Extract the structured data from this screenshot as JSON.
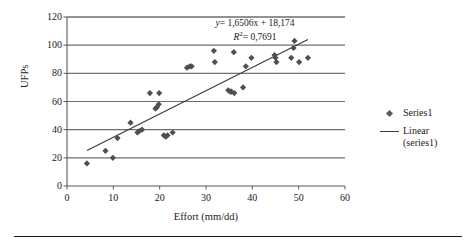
{
  "chart_data": {
    "type": "scatter",
    "title": "",
    "xlabel": "Effort (mm/dd)",
    "ylabel": "UFPs",
    "xlim": [
      0,
      60
    ],
    "ylim": [
      0,
      120
    ],
    "xticks": [
      0,
      10,
      20,
      30,
      40,
      50,
      60
    ],
    "yticks": [
      0,
      20,
      40,
      60,
      80,
      100,
      120
    ],
    "grid": "horizontal",
    "legend_position": "right",
    "series": [
      {
        "name": "Series1",
        "type": "scatter",
        "marker": "diamond",
        "color": "#4f4f4f",
        "points": [
          [
            4.3,
            16
          ],
          [
            8.3,
            25
          ],
          [
            9.9,
            20
          ],
          [
            10.9,
            34
          ],
          [
            13.7,
            45
          ],
          [
            15.2,
            38
          ],
          [
            15.6,
            39
          ],
          [
            16.2,
            40
          ],
          [
            17.9,
            66
          ],
          [
            19.1,
            55
          ],
          [
            19.4,
            56
          ],
          [
            19.8,
            58
          ],
          [
            19.9,
            66
          ],
          [
            20.9,
            36
          ],
          [
            21.3,
            35
          ],
          [
            21.7,
            36
          ],
          [
            22.8,
            38
          ],
          [
            25.9,
            84
          ],
          [
            26.5,
            85
          ],
          [
            26.9,
            85
          ],
          [
            31.7,
            96
          ],
          [
            31.9,
            88
          ],
          [
            34.8,
            68
          ],
          [
            35.2,
            67
          ],
          [
            35.5,
            67
          ],
          [
            36.1,
            66
          ],
          [
            36.0,
            95
          ],
          [
            38.0,
            70
          ],
          [
            38.6,
            85
          ],
          [
            39.8,
            91
          ],
          [
            44.8,
            93
          ],
          [
            45.0,
            91
          ],
          [
            45.2,
            88
          ],
          [
            48.4,
            91
          ],
          [
            48.9,
            98
          ],
          [
            49.1,
            103
          ],
          [
            50.1,
            88
          ],
          [
            52.0,
            91
          ]
        ]
      },
      {
        "name": "Linear (series1)",
        "type": "line",
        "color": "#3a3a3a",
        "slope": 1.6506,
        "intercept": 18.174,
        "x_start": 4.3,
        "x_end": 52.0
      }
    ],
    "annotations": [
      {
        "text": "y = 1,6506x + 18,174",
        "equation_y": "y",
        "equation_body": " = 1,6506x + 18,174"
      },
      {
        "text": "R2 = 0,7691",
        "r2_symbol": "R",
        "r2_sup": "2",
        "r2_body": " = 0,7691"
      }
    ]
  },
  "axes": {
    "x": {
      "title": "Effort (mm/dd)",
      "ticks": [
        "0",
        "10",
        "20",
        "30",
        "40",
        "50",
        "60"
      ]
    },
    "y": {
      "title": "UFPs",
      "ticks": [
        "0",
        "20",
        "40",
        "60",
        "80",
        "100",
        "120"
      ]
    }
  },
  "equation": {
    "line1_var": "y",
    "line1_rest": "= 1,6506x + 18,174",
    "line2_var": "R",
    "line2_sup": "2",
    "line2_rest": "= 0,7691"
  },
  "legend": {
    "entries": [
      {
        "label": "Series1",
        "key": "diamond-marker"
      },
      {
        "label": "Linear (series1)",
        "key": "line-sample"
      }
    ],
    "series1_label": "Series1",
    "linear_label_line1": "Linear",
    "linear_label_line2": "(series1)"
  },
  "colors": {
    "marker": "#4f4f4f",
    "trendline": "#3a3a3a",
    "gridline": "#6e6e6e",
    "axis": "#5a5a5a",
    "text": "#1b1b1b"
  }
}
